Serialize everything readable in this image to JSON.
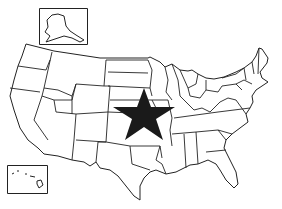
{
  "map": {
    "title": "United States map with star marker",
    "region": "Contiguous United States",
    "insets": [
      {
        "name": "Alaska",
        "box": [
          39,
          8,
          48,
          36
        ]
      },
      {
        "name": "Hawaii",
        "box": [
          7,
          165,
          40,
          28
        ]
      }
    ],
    "marker": {
      "type": "star",
      "color": "#1a1a1a",
      "center": [
        144,
        114
      ],
      "location": "Kansas / Oklahoma region"
    },
    "colors": {
      "land": "#ffffff",
      "border": "#222222",
      "background": "#ffffff"
    }
  }
}
